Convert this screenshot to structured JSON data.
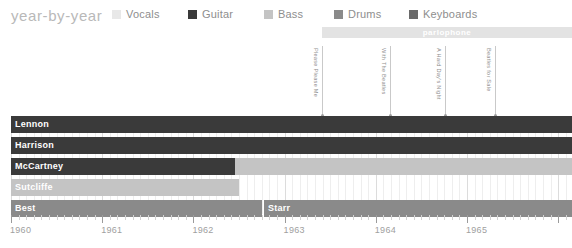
{
  "header": {
    "title": "year-by-year"
  },
  "legend": {
    "items": [
      {
        "label": "Vocals",
        "color": "#e8e8e8",
        "x": 0
      },
      {
        "label": "Guitar",
        "color": "#3a3a3a",
        "x": 76
      },
      {
        "label": "Bass",
        "color": "#c4c4c4",
        "x": 152
      },
      {
        "label": "Drums",
        "color": "#8a8a8a",
        "x": 222
      },
      {
        "label": "Keyboards",
        "color": "#6a6a6a",
        "x": 297
      }
    ]
  },
  "label_band": {
    "text": "parlophone",
    "color": "#e3e3e3",
    "start_x": 322,
    "end_x": 572,
    "y": 27
  },
  "annotations": [
    {
      "text": "Please Please Me",
      "x": 322,
      "top": 46,
      "bottom": 116
    },
    {
      "text": "With The Beatles",
      "x": 390,
      "top": 46,
      "bottom": 116
    },
    {
      "text": "A Hard Day's Night",
      "x": 445,
      "top": 46,
      "bottom": 116
    },
    {
      "text": "Beatles for Sale",
      "x": 495,
      "top": 46,
      "bottom": 116
    }
  ],
  "chart_data": {
    "type": "bar",
    "title": "year-by-year",
    "xlabel": "",
    "ylabel": "",
    "xlim": [
      1960.0,
      1965.9
    ],
    "grid": true,
    "legend_position": "top",
    "categories": [
      "Lennon",
      "Harrison",
      "McCartney",
      "Sutcliffe",
      "Best",
      "Starr"
    ],
    "axis_years": [
      "1960",
      "1961",
      "1962",
      "1963",
      "1964",
      "1965"
    ],
    "rows": [
      {
        "name": "Lennon",
        "y": 0,
        "label_color": "ondark",
        "segments": [
          {
            "role": "Guitar",
            "color": "#3a3a3a",
            "start_x": 0,
            "end_x": 561
          }
        ]
      },
      {
        "name": "Harrison",
        "y": 21,
        "label_color": "ondark",
        "segments": [
          {
            "role": "Guitar",
            "color": "#3a3a3a",
            "start_x": 0,
            "end_x": 561
          }
        ]
      },
      {
        "name": "McCartney",
        "y": 42,
        "label_color": "ondark",
        "segments": [
          {
            "role": "Guitar",
            "color": "#3a3a3a",
            "start_x": 0,
            "end_x": 224
          },
          {
            "role": "Bass",
            "color": "#c4c4c4",
            "start_x": 224,
            "end_x": 561
          }
        ]
      },
      {
        "name": "Sutcliffe",
        "y": 63,
        "label_color": "ongrey",
        "segments": [
          {
            "role": "Bass",
            "color": "#c4c4c4",
            "start_x": 0,
            "end_x": 228
          }
        ]
      },
      {
        "name": "Best",
        "y": 84,
        "label_color": "ongrey",
        "segments": [
          {
            "role": "Drums",
            "color": "#8a8a8a",
            "start_x": 0,
            "end_x": 251
          }
        ]
      },
      {
        "name": "Starr",
        "y": 84,
        "label_color": "ongrey",
        "segments": [
          {
            "role": "Drums",
            "color": "#8a8a8a",
            "start_x": 253,
            "end_x": 561
          }
        ]
      }
    ]
  }
}
